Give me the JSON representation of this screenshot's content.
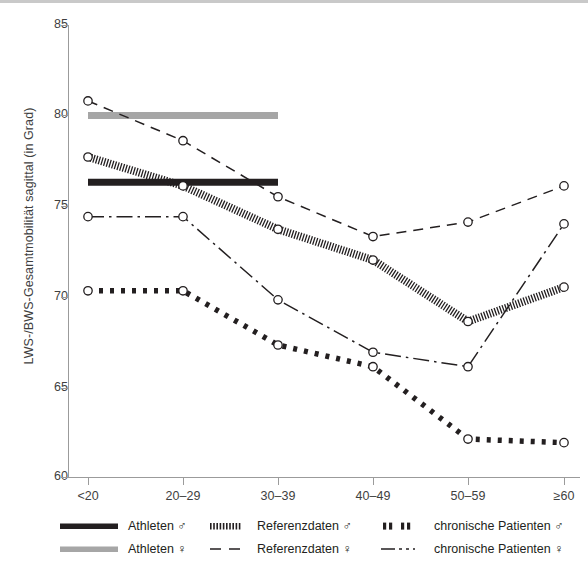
{
  "chart_data": {
    "type": "line",
    "title": "",
    "xlabel": "",
    "ylabel": "LWS-/BWS-Gesamtmobilität sagittal (in Grad)",
    "categories": [
      "<20",
      "20–29",
      "30–39",
      "40–49",
      "50–59",
      "≥60"
    ],
    "ylim": [
      60,
      85
    ],
    "yticks": [
      60,
      65,
      70,
      75,
      80,
      85
    ],
    "grid": false,
    "legend_position": "bottom",
    "series": [
      {
        "name": "Athleten ♂",
        "style": "thick-solid-black-bar",
        "color": "#231f20",
        "x": [
          "<20",
          "20–29",
          "30–39"
        ],
        "values": [
          76.3,
          76.3,
          76.3
        ]
      },
      {
        "name": "Athleten ♀",
        "style": "thick-solid-gray-bar",
        "color": "#a6a6a6",
        "x": [
          "<20",
          "20–29",
          "30–39"
        ],
        "values": [
          80.0,
          80.0,
          80.0
        ]
      },
      {
        "name": "Referenzdaten ♂",
        "style": "dense-hatched-band",
        "color": "#231f20",
        "x": [
          "<20",
          "20–29",
          "30–39",
          "40–49",
          "50–59",
          "≥60"
        ],
        "values": [
          77.7,
          76.1,
          73.7,
          72.0,
          68.6,
          70.5
        ]
      },
      {
        "name": "Referenzdaten ♀",
        "style": "dashed",
        "color": "#231f20",
        "x": [
          "<20",
          "20–29",
          "30–39",
          "40–49",
          "50–59",
          "≥60"
        ],
        "values": [
          80.8,
          78.6,
          75.5,
          73.3,
          74.1,
          76.1
        ]
      },
      {
        "name": "chronische Patienten ♂",
        "style": "thick-dotted",
        "color": "#231f20",
        "x": [
          "<20",
          "20–29",
          "30–39",
          "40–49",
          "50–59",
          "≥60"
        ],
        "values": [
          70.3,
          70.3,
          67.3,
          66.1,
          62.1,
          61.9
        ]
      },
      {
        "name": "chronische Patienten ♀",
        "style": "dash-dot",
        "color": "#231f20",
        "x": [
          "<20",
          "20–29",
          "30–39",
          "40–49",
          "50–59",
          "≥60"
        ],
        "values": [
          74.4,
          74.4,
          69.8,
          66.9,
          66.1,
          74.0
        ]
      }
    ]
  },
  "axes": {
    "y_tick_labels": [
      "85",
      "80",
      "75",
      "70",
      "65",
      "60"
    ],
    "x_tick_labels": [
      "<20",
      "20–29",
      "30–39",
      "40–49",
      "50–59",
      "≥60"
    ],
    "y_axis_title": "LWS-/BWS-Gesamtmobilität sagittal (in Grad)"
  },
  "legend": {
    "row1": [
      {
        "label": "Athleten ♂",
        "style": "thick-solid-black-bar"
      },
      {
        "label": "Referenzdaten ♂",
        "style": "dense-hatched-band"
      },
      {
        "label": "chronische Patienten ♂",
        "style": "thick-dotted"
      }
    ],
    "row2": [
      {
        "label": "Athleten ♀",
        "style": "thick-solid-gray-bar"
      },
      {
        "label": "Referenzdaten ♀",
        "style": "dashed"
      },
      {
        "label": "chronische Patienten ♀",
        "style": "dash-dot"
      }
    ]
  },
  "colors": {
    "ink": "#231f20",
    "gray_series": "#a6a6a6",
    "axis": "#9b9b9b",
    "label": "#3f3f3f",
    "rule": "#c9c9c9",
    "background": "#ffffff"
  }
}
